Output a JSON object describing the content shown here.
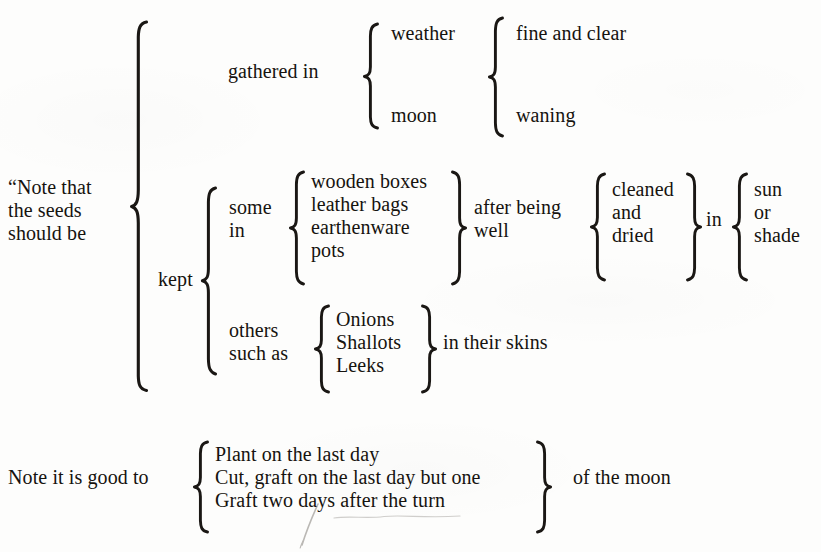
{
  "page": {
    "kind": "brace-diagram",
    "background_color": "#fdfdfc",
    "ink_color": "#16130f",
    "width": 821,
    "height": 552
  },
  "diagram": {
    "root_label": "“Note that\nthe seeds\nshould be",
    "root_label_lines": [
      "“Note that",
      "the seeds",
      "should be"
    ],
    "branches": {
      "gathered": {
        "label": "gathered in",
        "items": [
          "weather",
          "moon"
        ],
        "qualifiers": [
          "fine and clear",
          "waning"
        ]
      },
      "kept": {
        "label": "kept",
        "groups": {
          "some": {
            "label": "some\nin",
            "label_lines": [
              "some",
              "in"
            ],
            "containers": [
              "wooden boxes",
              "leather bags",
              "earthenware",
              "pots"
            ],
            "condition_label": "after being\nwell",
            "condition_label_lines": [
              "after being",
              "well"
            ],
            "treatments": [
              "cleaned",
              "and",
              "dried"
            ],
            "place_preposition": "in",
            "places": [
              "sun",
              "or",
              "shade"
            ]
          },
          "others": {
            "label": "others\nsuch as",
            "label_lines": [
              "others",
              "such as"
            ],
            "examples": [
              "Onions",
              "Shallots",
              "Leeks"
            ],
            "suffix": "in their skins"
          }
        }
      }
    }
  },
  "footnote": {
    "lead_in": "Note it is good to",
    "instructions": [
      "Plant on the last day",
      "Cut, graft on the last day but one",
      "Graft two days after the turn"
    ],
    "trailer": "of the moon"
  },
  "annotations": {
    "stray_ink_mark": "pen-stroke-below-two"
  }
}
